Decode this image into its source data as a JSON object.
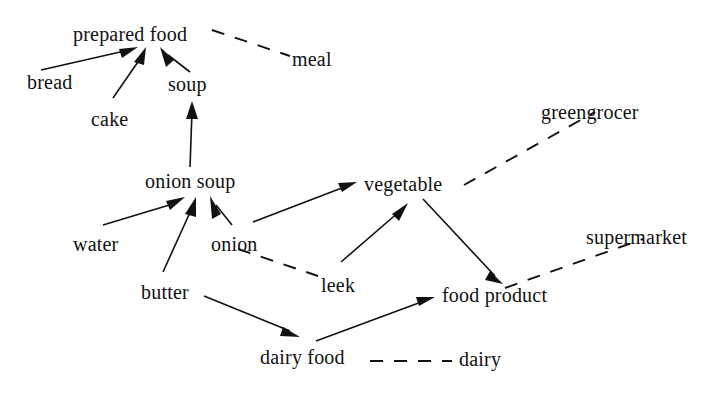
{
  "diagram": {
    "type": "directed-graph",
    "title": "",
    "background_color": "#ffffff",
    "line_color": "#111111",
    "nodes": [
      {
        "id": "prepared_food",
        "label": "prepared food",
        "x": 73,
        "y": 24
      },
      {
        "id": "meal",
        "label": "meal",
        "x": 292,
        "y": 49
      },
      {
        "id": "bread",
        "label": "bread",
        "x": 27,
        "y": 72
      },
      {
        "id": "soup",
        "label": "soup",
        "x": 168,
        "y": 74
      },
      {
        "id": "cake",
        "label": "cake",
        "x": 91,
        "y": 109
      },
      {
        "id": "greengrocer",
        "label": "greengrocer",
        "x": 541,
        "y": 102
      },
      {
        "id": "onion_soup",
        "label": "onion soup",
        "x": 145,
        "y": 171
      },
      {
        "id": "vegetable",
        "label": "vegetable",
        "x": 364,
        "y": 174
      },
      {
        "id": "supermarket",
        "label": "supermarket",
        "x": 586,
        "y": 227
      },
      {
        "id": "water",
        "label": "water",
        "x": 73,
        "y": 234
      },
      {
        "id": "onion",
        "label": "onion",
        "x": 211,
        "y": 234
      },
      {
        "id": "leek",
        "label": "leek",
        "x": 321,
        "y": 275
      },
      {
        "id": "food_product",
        "label": "food product",
        "x": 442,
        "y": 285
      },
      {
        "id": "butter",
        "label": "butter",
        "x": 141,
        "y": 282
      },
      {
        "id": "dairy_food",
        "label": "dairy food",
        "x": 260,
        "y": 347
      },
      {
        "id": "dairy",
        "label": "dairy",
        "x": 459,
        "y": 349
      }
    ],
    "solid_edges": [
      {
        "from": "bread",
        "to": "prepared_food",
        "style": "arrow"
      },
      {
        "from": "cake",
        "to": "prepared_food",
        "style": "arrow"
      },
      {
        "from": "soup",
        "to": "prepared_food",
        "style": "arrow"
      },
      {
        "from": "onion_soup",
        "to": "soup",
        "style": "arrow"
      },
      {
        "from": "water",
        "to": "onion_soup",
        "style": "arrow"
      },
      {
        "from": "butter",
        "to": "onion_soup",
        "style": "arrow"
      },
      {
        "from": "onion",
        "to": "onion_soup",
        "style": "arrow"
      },
      {
        "from": "onion",
        "to": "vegetable",
        "style": "arrow"
      },
      {
        "from": "leek",
        "to": "vegetable",
        "style": "arrow"
      },
      {
        "from": "vegetable",
        "to": "food_product",
        "style": "arrow"
      },
      {
        "from": "butter",
        "to": "dairy_food",
        "style": "arrow"
      },
      {
        "from": "dairy_food",
        "to": "food_product",
        "style": "arrow"
      }
    ],
    "dashed_edges": [
      {
        "from": "prepared_food",
        "to": "meal",
        "style": "dashed"
      },
      {
        "from": "vegetable",
        "to": "greengrocer",
        "style": "dashed"
      },
      {
        "from": "food_product",
        "to": "supermarket",
        "style": "dashed"
      },
      {
        "from": "onion",
        "to": "leek",
        "style": "dashed"
      },
      {
        "from": "dairy_food",
        "to": "dairy",
        "style": "dashed"
      }
    ]
  }
}
